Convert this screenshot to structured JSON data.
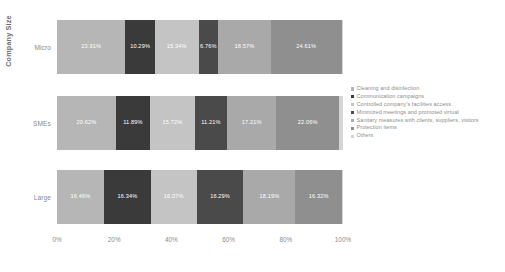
{
  "chart_data": {
    "type": "bar",
    "orientation": "horizontal",
    "stacked": true,
    "normalized": "100%",
    "title": "",
    "xlabel": "",
    "ylabel": "Company Size",
    "xlim": [
      0,
      100
    ],
    "xticks": [
      "0%",
      "20%",
      "40%",
      "60%",
      "80%",
      "100%"
    ],
    "grid": false,
    "legend_position": "right",
    "categories": [
      "Micro",
      "SMEs",
      "Large"
    ],
    "series": [
      {
        "name": "Cleaning and disinfection",
        "color": "#b6b6b6",
        "values": [
          23.91,
          20.62,
          16.46
        ],
        "labels": [
          "23.91%",
          "20.62%",
          "16.46%"
        ]
      },
      {
        "name": "Communication campaigns",
        "color": "#3a3a3a",
        "values": [
          10.29,
          11.89,
          16.34
        ],
        "labels": [
          "10.29%",
          "11.89%",
          "16.34%"
        ]
      },
      {
        "name": "Controlled company's facilities access",
        "color": "#c4c4c4",
        "values": [
          15.34,
          15.72,
          16.07
        ],
        "labels": [
          "15.34%",
          "15.72%",
          "16.07%"
        ]
      },
      {
        "name": "Minimized meetings and promoted virtual",
        "color": "#4a4a4a",
        "values": [
          6.76,
          11.21,
          16.29
        ],
        "labels": [
          "6.76%",
          "11.21%",
          "16.29%"
        ]
      },
      {
        "name": "Sanitary measures with clients, suppliers, visitors",
        "color": "#a9a9a9",
        "values": [
          18.57,
          17.21,
          18.19
        ],
        "labels": [
          "18.57%",
          "17.21%",
          "18.19%"
        ]
      },
      {
        "name": "Protection items",
        "color": "#8f8f8f",
        "values": [
          24.61,
          22.06,
          16.32
        ],
        "labels": [
          "24.61%",
          "22.06%",
          "16.32%"
        ]
      },
      {
        "name": "Others",
        "color": "#d5d5d5",
        "values": [
          0.52,
          1.29,
          0.33
        ],
        "labels": [
          "",
          "",
          ""
        ]
      }
    ]
  },
  "axes": {
    "y_title": "Company Size",
    "category_labels": [
      "Micro",
      "SMEs",
      "Large"
    ],
    "x_tick_labels": [
      "0%",
      "20%",
      "40%",
      "60%",
      "80%",
      "100%"
    ]
  },
  "legend": {
    "items": [
      {
        "label": "Cleaning and disinfection",
        "color": "#b6b6b6"
      },
      {
        "label": "Communication campaigns",
        "color": "#3a3a3a"
      },
      {
        "label": "Controlled company's facilities access",
        "color": "#c4c4c4"
      },
      {
        "label": "Minimized meetings and promoted virtual",
        "color": "#4a4a4a"
      },
      {
        "label": "Sanitary measures with clients, suppliers, visitors",
        "color": "#a9a9a9"
      },
      {
        "label": "Protection items",
        "color": "#8f8f8f"
      },
      {
        "label": "Others",
        "color": "#d5d5d5"
      }
    ]
  },
  "colors": {
    "background": "#ffffff",
    "text": "#8a8a8a",
    "label_text": "#ffffff"
  }
}
